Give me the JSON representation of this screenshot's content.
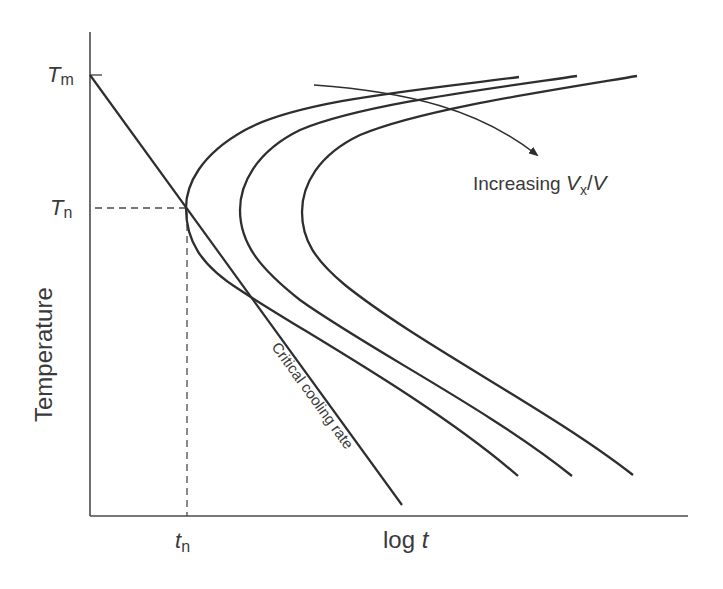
{
  "diagram": {
    "type": "TTT (time-temperature-transformation) curves with critical cooling rate",
    "y_axis": {
      "label": "Temperature",
      "ticks": [
        {
          "symbol": "T",
          "sub": "m"
        },
        {
          "symbol": "T",
          "sub": "n"
        }
      ]
    },
    "x_axis": {
      "label_prefix": "log ",
      "label_var": "t",
      "ticks": [
        {
          "symbol": "t",
          "sub": "n"
        }
      ]
    },
    "annotations": {
      "arrow_label_prefix": "Increasing ",
      "arrow_label_var1": "V",
      "arrow_label_sub": "x",
      "arrow_label_sep": "/",
      "arrow_label_var2": "V",
      "critical_line_label": "Critical cooling rate"
    },
    "curves": [
      {
        "name": "ttt-curve-1",
        "nose": [
          186,
          208
        ]
      },
      {
        "name": "ttt-curve-2",
        "nose": [
          240,
          210
        ]
      },
      {
        "name": "ttt-curve-3",
        "nose": [
          302,
          210
        ]
      }
    ],
    "colors": {
      "line": "#2e2e2e",
      "text": "#3a3a3a",
      "background": "#ffffff"
    }
  }
}
